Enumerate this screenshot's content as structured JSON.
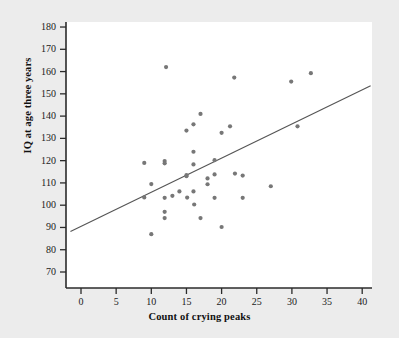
{
  "chart_data": {
    "type": "scatter",
    "title": "",
    "xlabel": "Count of crying peaks",
    "ylabel": "IQ at age three years",
    "xlim": [
      -1.5,
      41.5
    ],
    "ylim": [
      67,
      182
    ],
    "xticks": [
      0,
      5,
      10,
      15,
      20,
      25,
      30,
      35,
      40
    ],
    "yticks": [
      70,
      80,
      90,
      100,
      110,
      120,
      130,
      140,
      150,
      160,
      170,
      180
    ],
    "grid": false,
    "legend": null,
    "point_color": "#777777",
    "line_color": "#555555",
    "axis_color": "#2b2b2b",
    "background_color": "#ececec",
    "plot_background_color": "#ffffff",
    "points": [
      {
        "x": 9.0,
        "y": 119.0
      },
      {
        "x": 9.0,
        "y": 103.5
      },
      {
        "x": 10.0,
        "y": 109.5
      },
      {
        "x": 10.0,
        "y": 87.0
      },
      {
        "x": 11.9,
        "y": 119.8
      },
      {
        "x": 11.9,
        "y": 118.8
      },
      {
        "x": 11.9,
        "y": 103.3
      },
      {
        "x": 11.9,
        "y": 97.0
      },
      {
        "x": 11.9,
        "y": 94.2
      },
      {
        "x": 12.1,
        "y": 162.0
      },
      {
        "x": 13.0,
        "y": 104.2
      },
      {
        "x": 14.0,
        "y": 106.2
      },
      {
        "x": 15.0,
        "y": 133.5
      },
      {
        "x": 15.0,
        "y": 113.5
      },
      {
        "x": 15.0,
        "y": 113.0
      },
      {
        "x": 15.1,
        "y": 103.4
      },
      {
        "x": 16.0,
        "y": 136.3
      },
      {
        "x": 16.0,
        "y": 124.0
      },
      {
        "x": 16.0,
        "y": 118.3
      },
      {
        "x": 16.0,
        "y": 106.2
      },
      {
        "x": 16.1,
        "y": 100.3
      },
      {
        "x": 17.0,
        "y": 141.0
      },
      {
        "x": 17.0,
        "y": 94.2
      },
      {
        "x": 18.0,
        "y": 112.0
      },
      {
        "x": 18.0,
        "y": 109.4
      },
      {
        "x": 19.0,
        "y": 120.2
      },
      {
        "x": 19.0,
        "y": 113.8
      },
      {
        "x": 19.0,
        "y": 103.3
      },
      {
        "x": 20.0,
        "y": 132.5
      },
      {
        "x": 20.0,
        "y": 90.2
      },
      {
        "x": 21.2,
        "y": 135.4
      },
      {
        "x": 21.8,
        "y": 157.3
      },
      {
        "x": 21.9,
        "y": 114.2
      },
      {
        "x": 23.0,
        "y": 113.3
      },
      {
        "x": 23.0,
        "y": 103.3
      },
      {
        "x": 27.0,
        "y": 108.5
      },
      {
        "x": 29.9,
        "y": 155.5
      },
      {
        "x": 30.8,
        "y": 135.4
      },
      {
        "x": 32.7,
        "y": 159.3
      }
    ],
    "trendline": {
      "x_start": -1.5,
      "y_start": 88.2,
      "x_end": 41.2,
      "y_end": 153.6
    }
  }
}
